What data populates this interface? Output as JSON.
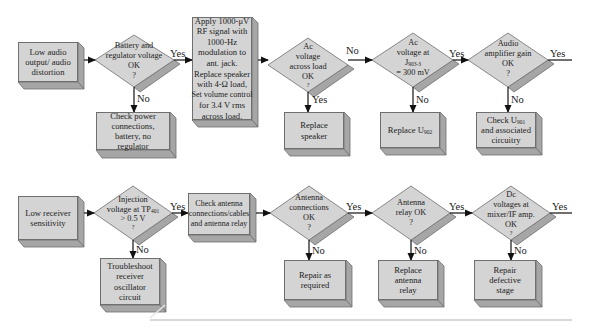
{
  "colors": {
    "box_fill": "#d4d4d4",
    "box_shadow": "#a6a6a6",
    "box_border": "#6f6f6f",
    "arrow": "#111111",
    "text": "#222222",
    "rule": "#d8d8d8"
  },
  "flowchart_top": {
    "start": {
      "text": "Low audio output/ audio distortion"
    },
    "decision1": {
      "line1": "Battery and",
      "line2": "regulator voltage",
      "line3": "OK",
      "line4": "?"
    },
    "decision1_yes": "Yes",
    "decision1_no": "No",
    "action1_no": {
      "text": "Check power connections, battery, no regulator"
    },
    "process1": {
      "lines": [
        "Apply 1000-μV",
        "RF signal with",
        "1000-Hz",
        "modulation to",
        "ant. jack.",
        "Replace speaker",
        "with 4-Ω load,",
        "Set volume control",
        "for 3.4 V rms",
        "across load."
      ]
    },
    "decision2": {
      "line1": "Ac",
      "line2": "voltage",
      "line3": "across load",
      "line4": "OK",
      "line5": "?"
    },
    "decision2_no": "No",
    "decision2_yes": "Yes",
    "action2_yes": {
      "text": "Replace speaker"
    },
    "decision3": {
      "line1": "Ac",
      "line2": "voltage at",
      "line3_main": "J",
      "line3_sub": "903-3",
      "line4": "= 300 mV"
    },
    "decision3_yes": "Yes",
    "decision3_no": "No",
    "action3_no": {
      "main": "Replace U",
      "sub": "902"
    },
    "decision4": {
      "line1": "Audio",
      "line2": "amplifier gain",
      "line3": "OK",
      "line4": "?"
    },
    "decision4_yes": "Yes",
    "decision4_no": "No",
    "action4_no": {
      "line1_main": "Check U",
      "line1_sub": "901",
      "line2": "and associated",
      "line3": "circuitry"
    }
  },
  "flowchart_bottom": {
    "start": {
      "text": "Low receiver sensitivity"
    },
    "decision1": {
      "line1": "Injection",
      "line2_main": "voltage at TP",
      "line2_sub": "401",
      "line3": "> 0.5 V",
      "line4": "?"
    },
    "decision1_yes": "Yes",
    "decision1_no": "No",
    "action1_no": {
      "lines": [
        "Troubleshoot",
        "receiver",
        "oscillator",
        "circuit"
      ]
    },
    "process1": {
      "lines": [
        "Check antenna",
        "connections/cables",
        "and antenna relay"
      ]
    },
    "decision2": {
      "line1": "Antenna",
      "line2": "connections",
      "line3": "OK",
      "line4": "?"
    },
    "decision2_yes": "Yes",
    "decision2_no": "No",
    "action2_no": {
      "lines": [
        "Repair as",
        "required"
      ]
    },
    "decision3": {
      "line1": "Antenna",
      "line2": "relay OK",
      "line3": "?"
    },
    "decision3_yes": "Yes",
    "decision3_no": "No",
    "action3_no": {
      "lines": [
        "Replace",
        "antenna",
        "relay"
      ]
    },
    "decision4": {
      "line1": "Dc",
      "line2": "voltages at",
      "line3": "mixer/IF amp.",
      "line4": "OK",
      "line5": "?"
    },
    "decision4_yes": "Yes",
    "decision4_no": "No",
    "action4_no": {
      "lines": [
        "Repair defective",
        "stage"
      ]
    }
  }
}
